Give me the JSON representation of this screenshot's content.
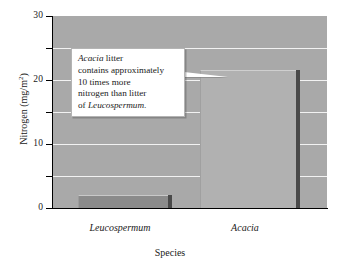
{
  "chart_data": {
    "type": "bar",
    "title": "",
    "subtitle": "",
    "categories": [
      "Leucospermum",
      "Acacia"
    ],
    "values": [
      2,
      21.5
    ],
    "series": [
      {
        "name": "Nitrogen",
        "values": [
          2,
          21.5
        ]
      }
    ],
    "xlabel": "Species",
    "ylabel": "Nitrogen (mg/m",
    "ylabel_superscript": "2",
    "ylabel_suffix": ")",
    "ylim": [
      0,
      30
    ],
    "yticks": [
      0,
      5,
      10,
      15,
      20,
      25,
      30
    ],
    "ytick_labels": [
      "0",
      "",
      "10",
      "",
      "20",
      "",
      "30"
    ],
    "grid": true,
    "gridlines_at": [
      5,
      10,
      15,
      20,
      25
    ],
    "legend": false,
    "annotations": [
      {
        "name": "acacia-callout",
        "lines": [
          {
            "italic_prefix": "Acacia",
            "rest": " litter"
          },
          {
            "italic_prefix": "",
            "rest": "contains approximately"
          },
          {
            "italic_prefix": "",
            "rest": "10 times more"
          },
          {
            "italic_prefix": "",
            "rest": "nitrogen than litter"
          },
          {
            "italic_prefix": "",
            "rest": "of ",
            "italic_suffix": "Leucospermum",
            "tail": "."
          }
        ],
        "points_to": "Acacia"
      }
    ],
    "colors": {
      "plot_background": "#a9a9a9",
      "gridline": "#f2f2f2",
      "bar_leucospermum": "#8b8b8b",
      "bar_acacia": "#b1b1b1",
      "bar_edge_shadow": "#4a4a4a",
      "axis": "#000000",
      "callout_background": "#ffffff",
      "text": "#1a1a1a"
    }
  },
  "axis": {
    "y": {
      "title_main": "Nitrogen (mg/m",
      "title_sup": "2",
      "title_end": ")",
      "labels": {
        "t30": "30",
        "t20": "20",
        "t10": "10",
        "t0": "0"
      }
    },
    "x": {
      "title": "Species",
      "labels": {
        "leucospermum": "Leucospermum",
        "acacia": "Acacia"
      }
    }
  },
  "callout": {
    "line1_italic": "Acacia",
    "line1_rest": " litter",
    "line2": "contains approximately",
    "line3": "10 times more",
    "line4": "nitrogen than litter",
    "line5_prefix": "of ",
    "line5_italic": "Leucospermum",
    "line5_tail": "."
  }
}
